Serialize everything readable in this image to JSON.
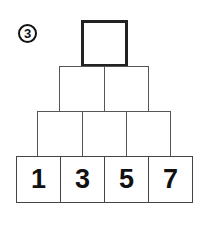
{
  "problem_number": "3",
  "pyramid": {
    "row1": [
      ""
    ],
    "row2": [
      "",
      ""
    ],
    "row3": [
      "",
      "",
      ""
    ],
    "row4": [
      "1",
      "3",
      "5",
      "7"
    ]
  }
}
